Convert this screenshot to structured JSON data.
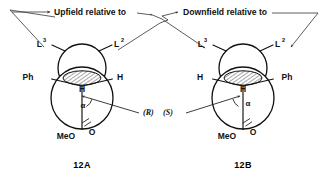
{
  "figure": {
    "caption_left": "12A",
    "caption_right": "12B",
    "headers": {
      "upfield": "Upfield relative to",
      "downfield": "Downfield relative to"
    }
  },
  "structures": [
    {
      "id": "12A",
      "caption": "12A",
      "configuration": "(R)",
      "labels": {
        "back_left": "L",
        "back_left_sup": "3",
        "back_right": "L",
        "back_right_sup": "2",
        "front_left": "Ph",
        "front_right": "H",
        "center": "H",
        "angle": "α",
        "bottom_left": "MeO",
        "bottom_right": "O"
      }
    },
    {
      "id": "12B",
      "caption": "12B",
      "configuration": "(S)",
      "labels": {
        "back_left": "L",
        "back_left_sup": "3",
        "back_right": "L",
        "back_right_sup": "2",
        "front_left": "H",
        "front_right": "Ph",
        "center": "H",
        "angle": "α",
        "bottom_left": "MeO",
        "bottom_right": "O"
      }
    }
  ],
  "colors": {
    "ink": "#111111",
    "paper": "#ffffff",
    "leader": "#333333"
  }
}
